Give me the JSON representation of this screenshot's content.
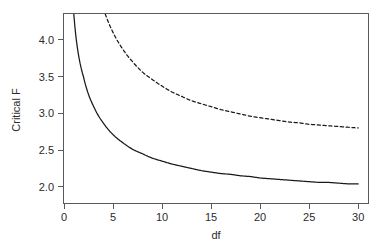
{
  "chart_data": {
    "type": "line",
    "title": "",
    "subtitle": "",
    "xlabel": "df",
    "ylabel": "Critical F",
    "xlim": [
      0,
      31
    ],
    "ylim": [
      1.78,
      4.35
    ],
    "grid": false,
    "legend": "none",
    "x_ticks": [
      "0",
      "5",
      "10",
      "15",
      "20",
      "25",
      "30"
    ],
    "x_tick_values": [
      0,
      5,
      10,
      15,
      20,
      25,
      30
    ],
    "y_ticks": [
      "2.0",
      "2.5",
      "3.0",
      "3.5",
      "4.0"
    ],
    "y_tick_values": [
      2.0,
      2.5,
      3.0,
      3.5,
      4.0
    ],
    "x": [
      1,
      2,
      3,
      4,
      5,
      6,
      7,
      8,
      9,
      10,
      11,
      12,
      13,
      14,
      15,
      16,
      17,
      18,
      19,
      20,
      21,
      22,
      23,
      24,
      25,
      26,
      27,
      28,
      29,
      30
    ],
    "series": [
      {
        "name": "solid-curve",
        "style": "solid",
        "color": "#1a1a1a",
        "values": [
          4.35,
          3.49,
          3.1,
          2.87,
          2.71,
          2.6,
          2.51,
          2.45,
          2.39,
          2.35,
          2.31,
          2.28,
          2.25,
          2.22,
          2.2,
          2.18,
          2.17,
          2.15,
          2.14,
          2.12,
          2.11,
          2.1,
          2.09,
          2.08,
          2.07,
          2.06,
          2.06,
          2.05,
          2.04,
          2.04
        ]
      },
      {
        "name": "dashed-curve",
        "style": "dashed",
        "color": "#1a1a1a",
        "values": [
          8.1,
          5.85,
          4.94,
          4.43,
          4.1,
          3.87,
          3.7,
          3.56,
          3.46,
          3.37,
          3.29,
          3.23,
          3.17,
          3.13,
          3.09,
          3.05,
          3.02,
          2.99,
          2.96,
          2.94,
          2.92,
          2.9,
          2.88,
          2.87,
          2.85,
          2.84,
          2.83,
          2.82,
          2.81,
          2.8
        ]
      }
    ]
  },
  "figure": {
    "axis_color": "#555b5e",
    "line_color": "#1a1a1a",
    "background": "#ffffff",
    "xlabel": "df",
    "ylabel": "Critical F"
  }
}
